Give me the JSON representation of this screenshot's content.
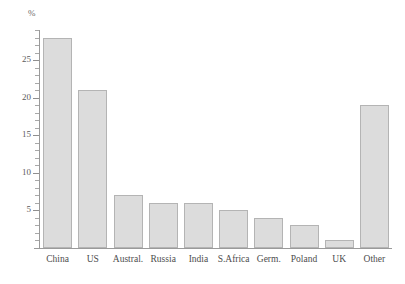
{
  "chart_data": {
    "type": "bar",
    "title": "",
    "subtitle": "",
    "xlabel": "",
    "ylabel": "%",
    "unit_label": "%",
    "categories": [
      "China",
      "US",
      "Austral.",
      "Russia",
      "India",
      "S.Africa",
      "Germ.",
      "Poland",
      "UK",
      "Other"
    ],
    "values": [
      28,
      21,
      7,
      6,
      6,
      5,
      4,
      3,
      1,
      19
    ],
    "ylim": [
      0,
      29
    ],
    "y_ticks_major": [
      5,
      10,
      15,
      20,
      25
    ],
    "y_tick_labels": [
      "5",
      "10",
      "15",
      "20",
      "25"
    ],
    "y_tick_minor_step": 1,
    "grid": false,
    "legend": null,
    "legend_position": "none",
    "annotations": [],
    "colors": {
      "bar_fill": "#dcdcdc",
      "bar_border": "#b4b4b4",
      "axis": "#9a9a9a",
      "tick_text": "#5b5b5b",
      "category_text": "#4d4d4d",
      "unit_text": "#6a6a6a",
      "background": "#ffffff"
    }
  }
}
